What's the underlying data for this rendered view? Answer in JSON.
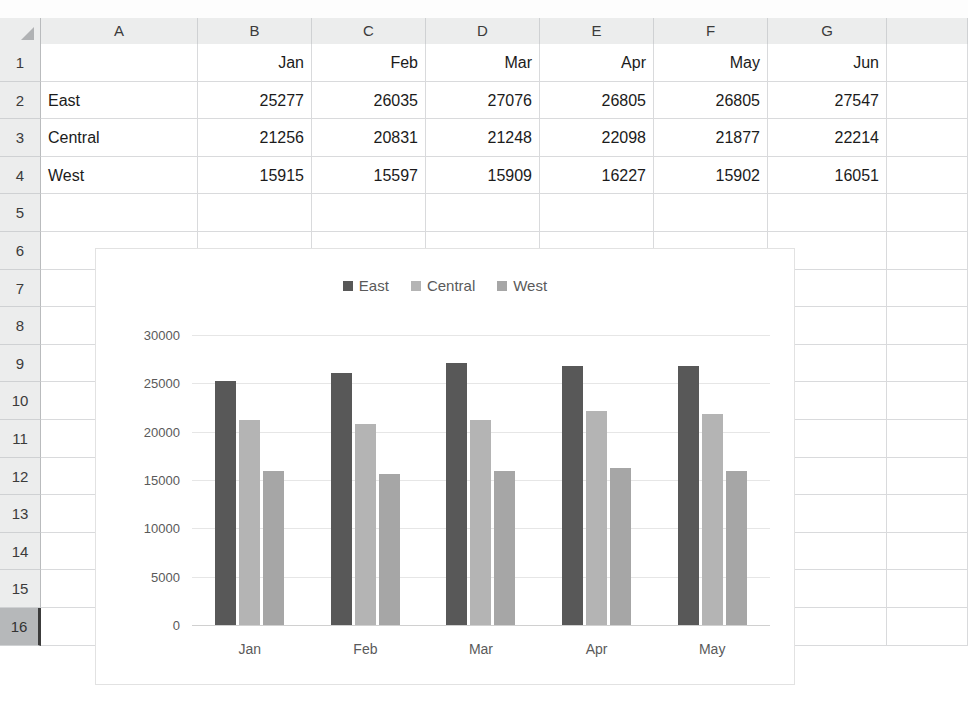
{
  "app": {
    "type": "spreadsheet",
    "select_all_icon": "select-all-triangle-icon"
  },
  "grid": {
    "columns": [
      "A",
      "B",
      "C",
      "D",
      "E",
      "F",
      "G"
    ],
    "rows": [
      "1",
      "2",
      "3",
      "4",
      "5",
      "6",
      "7",
      "8",
      "9",
      "10",
      "11",
      "12",
      "13",
      "14",
      "15",
      "16"
    ],
    "active_row": "16",
    "data": [
      {
        "A": "",
        "B": "Jan",
        "C": "Feb",
        "D": "Mar",
        "E": "Apr",
        "F": "May",
        "G": "Jun"
      },
      {
        "A": "East",
        "B": "25277",
        "C": "26035",
        "D": "27076",
        "E": "26805",
        "F": "26805",
        "G": "27547"
      },
      {
        "A": "Central",
        "B": "21256",
        "C": "20831",
        "D": "21248",
        "E": "22098",
        "F": "21877",
        "G": "22214"
      },
      {
        "A": "West",
        "B": "15915",
        "C": "15597",
        "D": "15909",
        "E": "16227",
        "F": "15902",
        "G": "16051"
      }
    ]
  },
  "chart_data": {
    "type": "bar",
    "title": "",
    "xlabel": "",
    "ylabel": "",
    "categories": [
      "Jan",
      "Feb",
      "Mar",
      "Apr",
      "May"
    ],
    "series": [
      {
        "name": "East",
        "color": "#585858",
        "values": [
          25277,
          26035,
          27076,
          26805,
          26805
        ]
      },
      {
        "name": "Central",
        "color": "#b4b4b4",
        "values": [
          21256,
          20831,
          21248,
          22098,
          21877
        ]
      },
      {
        "name": "West",
        "color": "#a6a6a6",
        "values": [
          15915,
          15597,
          15909,
          16227,
          15902
        ]
      }
    ],
    "yticks": [
      0,
      5000,
      10000,
      15000,
      20000,
      25000,
      30000
    ],
    "ylim": [
      0,
      30000
    ],
    "grid": true,
    "legend_position": "top"
  },
  "colors": {
    "header_bg": "#eceded",
    "gridline": "#d9dadc",
    "active_header_bg": "#b6b8ba",
    "chart_border": "#e2e2e2",
    "chart_gridline": "#e6e6e6"
  }
}
